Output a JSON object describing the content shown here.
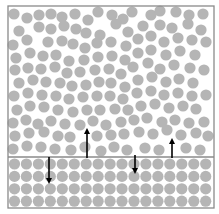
{
  "diagram": {
    "type": "solid-liquid interface",
    "frame": {
      "x": 8,
      "y": 6,
      "w": 206,
      "h": 202,
      "stroke": "#8a8a8a"
    },
    "interface_y": 157,
    "particle_color": "#b5b5b5",
    "particle_radius": 5.6,
    "arrow_color": "#000000",
    "lattice": {
      "x0": 14.5,
      "dx": 11.95,
      "cols": 17,
      "y0": 164,
      "dy": 12.4,
      "rows": 4
    },
    "liquid_particles": [
      [
        14,
        14
      ],
      [
        27,
        18
      ],
      [
        39,
        15
      ],
      [
        51,
        14
      ],
      [
        62,
        17
      ],
      [
        75,
        14
      ],
      [
        88,
        20
      ],
      [
        98,
        12
      ],
      [
        112,
        15
      ],
      [
        123,
        19
      ],
      [
        132,
        12
      ],
      [
        151,
        15
      ],
      [
        160,
        11
      ],
      [
        176,
        12
      ],
      [
        189,
        15
      ],
      [
        203,
        14
      ],
      [
        19,
        31
      ],
      [
        39,
        27
      ],
      [
        51,
        29
      ],
      [
        64,
        26
      ],
      [
        76,
        29
      ],
      [
        86,
        33
      ],
      [
        100,
        35
      ],
      [
        116,
        24
      ],
      [
        128,
        32
      ],
      [
        143,
        26
      ],
      [
        160,
        25
      ],
      [
        172,
        28
      ],
      [
        188,
        24
      ],
      [
        201,
        30
      ],
      [
        13,
        45
      ],
      [
        27,
        40
      ],
      [
        48,
        42
      ],
      [
        62,
        41
      ],
      [
        73,
        44
      ],
      [
        85,
        48
      ],
      [
        97,
        43
      ],
      [
        111,
        42
      ],
      [
        126,
        46
      ],
      [
        138,
        39
      ],
      [
        151,
        36
      ],
      [
        164,
        42
      ],
      [
        178,
        38
      ],
      [
        192,
        40
      ],
      [
        206,
        42
      ],
      [
        16,
        58
      ],
      [
        30,
        53
      ],
      [
        43,
        56
      ],
      [
        56,
        55
      ],
      [
        69,
        61
      ],
      [
        84,
        60
      ],
      [
        98,
        57
      ],
      [
        112,
        56
      ],
      [
        125,
        60
      ],
      [
        138,
        53
      ],
      [
        151,
        50
      ],
      [
        166,
        55
      ],
      [
        180,
        51
      ],
      [
        195,
        55
      ],
      [
        15,
        70
      ],
      [
        28,
        68
      ],
      [
        41,
        69
      ],
      [
        55,
        67
      ],
      [
        67,
        73
      ],
      [
        80,
        72
      ],
      [
        95,
        70
      ],
      [
        109,
        69
      ],
      [
        121,
        74
      ],
      [
        133,
        67
      ],
      [
        148,
        63
      ],
      [
        160,
        69
      ],
      [
        174,
        65
      ],
      [
        190,
        68
      ],
      [
        204,
        70
      ],
      [
        19,
        83
      ],
      [
        33,
        80
      ],
      [
        46,
        82
      ],
      [
        60,
        83
      ],
      [
        72,
        86
      ],
      [
        86,
        85
      ],
      [
        99,
        82
      ],
      [
        111,
        83
      ],
      [
        125,
        87
      ],
      [
        138,
        80
      ],
      [
        152,
        77
      ],
      [
        166,
        82
      ],
      [
        179,
        79
      ],
      [
        193,
        83
      ],
      [
        14,
        96
      ],
      [
        28,
        93
      ],
      [
        42,
        95
      ],
      [
        56,
        96
      ],
      [
        69,
        99
      ],
      [
        83,
        97
      ],
      [
        97,
        96
      ],
      [
        110,
        96
      ],
      [
        123,
        99
      ],
      [
        137,
        93
      ],
      [
        151,
        91
      ],
      [
        164,
        95
      ],
      [
        178,
        93
      ],
      [
        192,
        96
      ],
      [
        206,
        95
      ],
      [
        17,
        110
      ],
      [
        30,
        106
      ],
      [
        44,
        107
      ],
      [
        58,
        110
      ],
      [
        73,
        112
      ],
      [
        87,
        110
      ],
      [
        100,
        110
      ],
      [
        115,
        109
      ],
      [
        128,
        110
      ],
      [
        141,
        106
      ],
      [
        155,
        104
      ],
      [
        169,
        108
      ],
      [
        183,
        106
      ],
      [
        196,
        109
      ],
      [
        13,
        123
      ],
      [
        26,
        120
      ],
      [
        38,
        124
      ],
      [
        51,
        121
      ],
      [
        65,
        124
      ],
      [
        80,
        125
      ],
      [
        93,
        121
      ],
      [
        106,
        125
      ],
      [
        121,
        122
      ],
      [
        134,
        120
      ],
      [
        147,
        118
      ],
      [
        162,
        122
      ],
      [
        175,
        120
      ],
      [
        189,
        123
      ],
      [
        204,
        122
      ],
      [
        15,
        136
      ],
      [
        29,
        133
      ],
      [
        44,
        132
      ],
      [
        58,
        136
      ],
      [
        70,
        137
      ],
      [
        97,
        136
      ],
      [
        111,
        135
      ],
      [
        124,
        134
      ],
      [
        139,
        132
      ],
      [
        153,
        134
      ],
      [
        167,
        130
      ],
      [
        181,
        135
      ],
      [
        196,
        133
      ],
      [
        208,
        136
      ],
      [
        13,
        149
      ],
      [
        27,
        146
      ],
      [
        41,
        147
      ],
      [
        55,
        149
      ],
      [
        71,
        150
      ],
      [
        85,
        147
      ],
      [
        101,
        151
      ],
      [
        114,
        147
      ],
      [
        127,
        150
      ],
      [
        145,
        148
      ],
      [
        159,
        150
      ],
      [
        186,
        148
      ],
      [
        200,
        150
      ]
    ],
    "arrows": [
      {
        "name": "arrow-down-1",
        "x": 49,
        "y1": 157,
        "y2": 181,
        "direction": "down"
      },
      {
        "name": "arrow-up-1",
        "x": 87,
        "y1": 158,
        "y2": 131,
        "direction": "up"
      },
      {
        "name": "arrow-down-2",
        "x": 135,
        "y1": 155,
        "y2": 171,
        "direction": "down"
      },
      {
        "name": "arrow-up-2",
        "x": 172,
        "y1": 158,
        "y2": 141,
        "direction": "up"
      }
    ]
  }
}
